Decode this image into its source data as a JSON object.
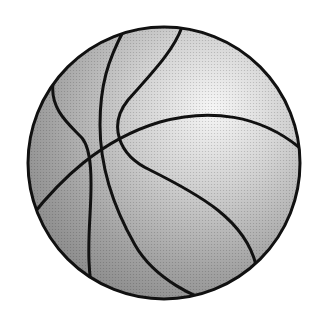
{
  "image": {
    "subject": "basketball",
    "style": "halftone grayscale clip art",
    "colors": {
      "background": "#ffffff",
      "outline": "#111111",
      "highlight": "#f4f4f4",
      "shade": "#8a8a8a"
    }
  }
}
